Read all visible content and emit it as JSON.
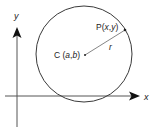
{
  "diagram": {
    "colors": {
      "stroke": "#3a3a3a",
      "axis": "#555555",
      "radius": "#666666",
      "text": "#222222",
      "background": "#ffffff"
    },
    "axes": {
      "x_label": "x",
      "y_label": "y"
    },
    "center": {
      "prefix": "C",
      "open": " (",
      "a": "a",
      "comma": ",",
      "b": "b",
      "close": ")"
    },
    "point": {
      "prefix": "P",
      "open": "(",
      "x": "x",
      "comma": ",",
      "y": "y",
      "close": ")"
    },
    "radius_label": "r"
  }
}
